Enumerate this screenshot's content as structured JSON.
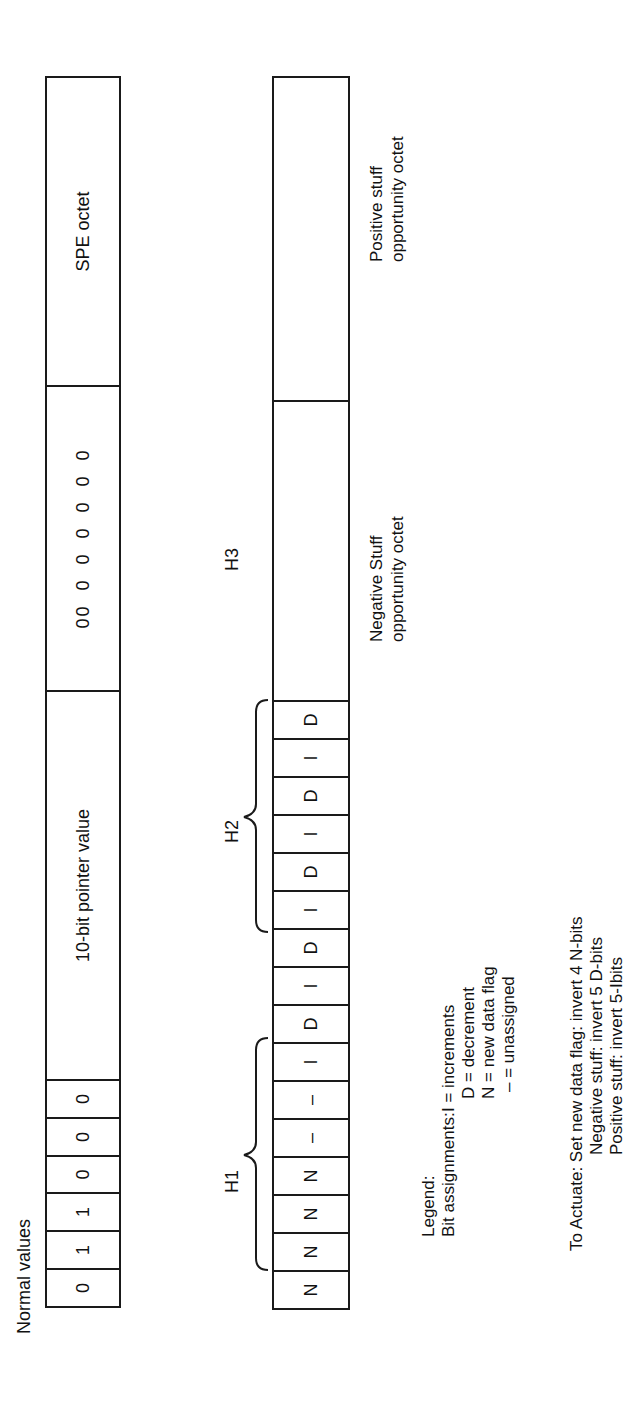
{
  "row1": {
    "title": "Normal values",
    "bits": [
      "0",
      "1",
      "1",
      "0",
      "0",
      "0"
    ],
    "pointer_label": "10-bit pointer value",
    "zeros": "00  0  0  0  0  0  0",
    "spe_label": "SPE octet"
  },
  "row2": {
    "h1_label": "H1",
    "h2_label": "H2",
    "h3_label": "H3",
    "bits": [
      "N",
      "N",
      "N",
      "N",
      "–",
      "–",
      "I",
      "D",
      "I",
      "D",
      "I",
      "D",
      "I",
      "D",
      "I",
      "D"
    ],
    "negative_label_1": "Negative Stuff",
    "negative_label_2": "opportunity octet",
    "positive_label_1": "Positive stuff",
    "positive_label_2": "opportunity octet"
  },
  "legend": {
    "title": "Legend:",
    "bit_assignments": "Bit assignments:",
    "items": [
      "I = increments",
      "D = decrement",
      "N = new data flag",
      "– = unassigned"
    ]
  },
  "actuate": {
    "line1": "To Actuate: Set new data flag: invert 4 N-bits",
    "line2": "Negative stuff: invert 5 D-bits",
    "line3": "Positive stuff: invert 5-Ibits"
  }
}
